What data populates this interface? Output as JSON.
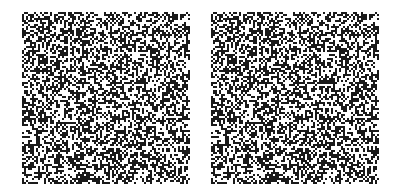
{
  "figure": {
    "type": "random-dot-stereogram",
    "panels": [
      {
        "id": "left",
        "label": "",
        "grid_cols": 84,
        "grid_rows": 86,
        "dot_px": 2,
        "density": 0.5,
        "seed": 12345,
        "shift": 0
      },
      {
        "id": "right",
        "label": "",
        "grid_cols": 84,
        "grid_rows": 86,
        "dot_px": 2,
        "density": 0.5,
        "seed": 12345,
        "shift": 3
      }
    ],
    "colors": {
      "dot": "#1a1a1a",
      "background": "#ffffff"
    }
  }
}
